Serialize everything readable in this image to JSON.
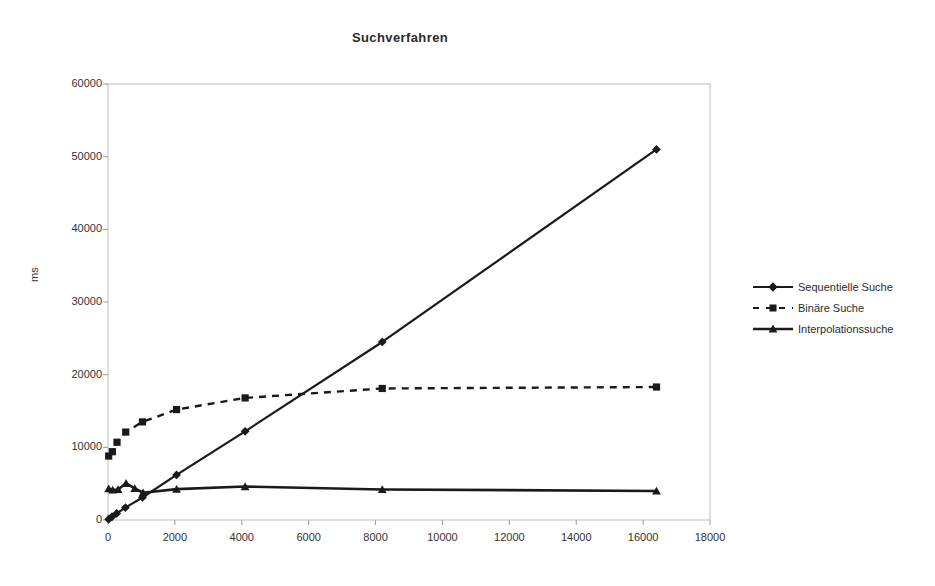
{
  "chart_data": {
    "type": "line",
    "title": "Suchverfahren",
    "xlabel": "",
    "ylabel": "ms",
    "xlim": [
      0,
      18000
    ],
    "ylim": [
      0,
      60000
    ],
    "xticks": [
      0,
      2000,
      4000,
      6000,
      8000,
      10000,
      12000,
      14000,
      16000,
      18000
    ],
    "yticks": [
      0,
      10000,
      20000,
      30000,
      40000,
      50000,
      60000
    ],
    "grid": false,
    "legend_position": "right",
    "series": [
      {
        "name": "Sequentielle Suche",
        "marker": "diamond",
        "line": "solid",
        "color": "#1a1a1a",
        "points": [
          [
            20,
            100
          ],
          [
            120,
            450
          ],
          [
            260,
            900
          ],
          [
            520,
            1700
          ],
          [
            1030,
            3100
          ],
          [
            2050,
            6200
          ],
          [
            4100,
            12200
          ],
          [
            8200,
            24500
          ],
          [
            16400,
            51000
          ]
        ]
      },
      {
        "name": "Binäre Suche",
        "marker": "square",
        "line": "dashed",
        "color": "#1a1a1a",
        "points": [
          [
            20,
            8800
          ],
          [
            130,
            9400
          ],
          [
            270,
            10700
          ],
          [
            530,
            12100
          ],
          [
            1030,
            13500
          ],
          [
            2050,
            15200
          ],
          [
            4100,
            16800
          ],
          [
            8200,
            18100
          ],
          [
            16400,
            18300
          ]
        ]
      },
      {
        "name": "Interpolationssuche",
        "marker": "triangle",
        "line": "solid",
        "color": "#1a1a1a",
        "points": [
          [
            20,
            4300
          ],
          [
            140,
            4150
          ],
          [
            300,
            4200
          ],
          [
            540,
            5050
          ],
          [
            800,
            4350
          ],
          [
            1050,
            3750
          ],
          [
            2050,
            4250
          ],
          [
            4100,
            4600
          ],
          [
            8200,
            4200
          ],
          [
            16400,
            4000
          ]
        ]
      }
    ]
  },
  "legend": {
    "items": [
      {
        "label": "Sequentielle Suche",
        "marker": "diamond-marker"
      },
      {
        "label": "Binäre Suche",
        "marker": "square-marker"
      },
      {
        "label": "Interpolationssuche",
        "marker": "triangle-marker"
      }
    ]
  },
  "axes": {
    "y_labels": [
      "60000",
      "50000",
      "40000",
      "30000",
      "20000",
      "10000",
      "0"
    ],
    "x_labels": [
      "0",
      "2000",
      "4000",
      "6000",
      "8000",
      "10000",
      "12000",
      "14000",
      "16000",
      "18000"
    ],
    "y_title": "ms"
  }
}
